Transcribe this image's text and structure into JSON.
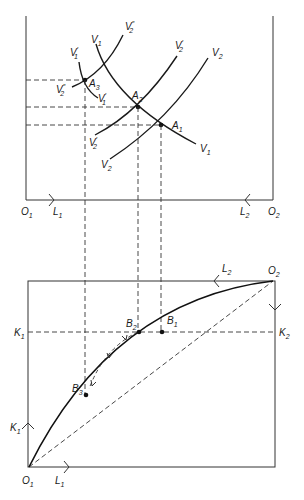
{
  "diagram": {
    "type": "edgeworth-box-factor-price-equalization",
    "colors": {
      "ink": "#1a1a1a",
      "box": "#333333",
      "dashed": "#333333"
    },
    "top_panel": {
      "origin_left": {
        "base": "O",
        "sub": "1"
      },
      "origin_right": {
        "base": "O",
        "sub": "2"
      },
      "axis_left_label": {
        "base": "L",
        "sub": "1"
      },
      "axis_right_label": {
        "base": "L",
        "sub": "2"
      },
      "curves": [
        {
          "id": "V1",
          "base": "V",
          "sub": "1",
          "prime": "",
          "end_label": {
            "base": "V",
            "sub": "1"
          }
        },
        {
          "id": "V2",
          "base": "V",
          "sub": "2",
          "prime": "",
          "end_label": {
            "base": "V",
            "sub": "2"
          }
        },
        {
          "id": "V1p",
          "base": "V",
          "sub": "1",
          "prime": "′",
          "end_label": {
            "base": "V",
            "sub": "1",
            "prime": "′"
          }
        },
        {
          "id": "V2p",
          "base": "V",
          "sub": "2",
          "prime": "′",
          "end_label": {
            "base": "V",
            "sub": "2",
            "prime": "′"
          }
        },
        {
          "id": "V2pp",
          "base": "V",
          "sub": "2",
          "prime": "″",
          "end_label": {
            "base": "V",
            "sub": "2",
            "prime": "″"
          }
        }
      ],
      "points": [
        {
          "id": "A1",
          "base": "A",
          "sub": "1"
        },
        {
          "id": "A2",
          "base": "A",
          "sub": "2"
        },
        {
          "id": "A3",
          "base": "A",
          "sub": "3"
        }
      ]
    },
    "bottom_panel": {
      "origin_bottom_left": {
        "base": "O",
        "sub": "1"
      },
      "origin_top_right": {
        "base": "O",
        "sub": "2"
      },
      "labels": {
        "L1": {
          "base": "L",
          "sub": "1"
        },
        "L2": {
          "base": "L",
          "sub": "2"
        },
        "K1_axis": {
          "base": "K",
          "sub": "1"
        },
        "K1_line": {
          "base": "K",
          "sub": "1"
        },
        "K2_line": {
          "base": "K",
          "sub": "2"
        }
      },
      "points": [
        {
          "id": "B1",
          "base": "B",
          "sub": "1"
        },
        {
          "id": "B2",
          "base": "B",
          "sub": "2"
        },
        {
          "id": "B3",
          "base": "B",
          "sub": "3"
        }
      ],
      "contract_curve": "solid bowed curve from O1 to O2",
      "diagonal": "dashed straight line O1 to O2",
      "adjustment_path": "dashed arrowed arc from B2 to B3"
    }
  }
}
